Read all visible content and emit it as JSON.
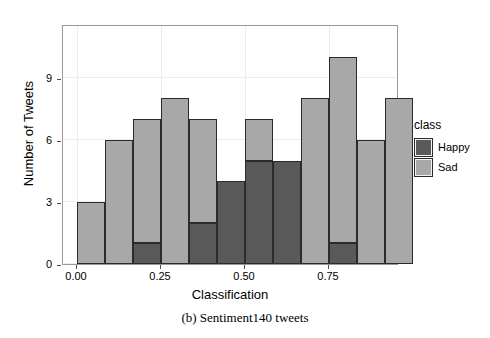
{
  "chart_data": {
    "type": "bar",
    "subtype": "stacked-histogram",
    "title": "",
    "xlabel": "Classification",
    "ylabel": "Number of Tweets",
    "xlim": [
      -0.0417,
      0.9583
    ],
    "ylim": [
      0,
      11.6
    ],
    "xticks": [
      0.0,
      0.25,
      0.5,
      0.75
    ],
    "xtick_labels": [
      "0.00",
      "0.25",
      "0.50",
      "0.75"
    ],
    "yticks": [
      0,
      3,
      6,
      9
    ],
    "ytick_labels": [
      "0",
      "3",
      "6",
      "9"
    ],
    "grid": true,
    "bin_width": 0.0833,
    "bin_starts": [
      0.0,
      0.0833,
      0.1667,
      0.25,
      0.3333,
      0.4167,
      0.5,
      0.5833,
      0.6667,
      0.75,
      0.8333,
      0.9167
    ],
    "legend": {
      "title": "class",
      "position": "right",
      "entries": [
        {
          "name": "Happy",
          "color": "#595959"
        },
        {
          "name": "Sad",
          "color": "#a8a8a8"
        }
      ]
    },
    "series": [
      {
        "name": "Happy",
        "color": "#595959",
        "values": [
          0,
          0,
          1,
          0,
          2,
          4,
          5,
          5,
          0,
          1,
          0,
          0
        ]
      },
      {
        "name": "Sad",
        "color": "#a8a8a8",
        "values": [
          3,
          6,
          6,
          8,
          5,
          0,
          2,
          0,
          8,
          9,
          6,
          8
        ]
      }
    ],
    "totals": [
      3,
      6,
      7,
      8,
      7,
      4,
      7,
      5,
      8,
      10,
      6,
      8
    ]
  },
  "caption": "(b) Sentiment140 tweets",
  "colors": {
    "happy": "#595959",
    "sad": "#a8a8a8",
    "bar_outline": "#2b2b2b",
    "panel_border": "#999999",
    "gridline": "#ededed"
  }
}
